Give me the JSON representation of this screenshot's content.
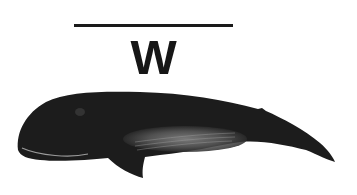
{
  "card": {
    "letter": "W",
    "illustration": "whale",
    "colors": {
      "ink": "#161616",
      "body": "#1c1c1c",
      "belly": "#6e6e6e",
      "background": "#ffffff"
    }
  }
}
